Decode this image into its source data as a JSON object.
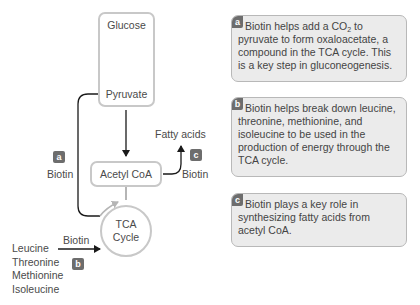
{
  "diagram": {
    "nodes": {
      "glucose": "Glucose",
      "pyruvate": "Pyruvate",
      "acetyl_coa": "Acetyl CoA",
      "tca_line1": "TCA",
      "tca_line2": "Cycle",
      "fatty_acids": "Fatty acids"
    },
    "labels": {
      "biotin_a": "Biotin",
      "biotin_b": "Biotin",
      "biotin_c": "Biotin"
    },
    "amino_acids": [
      "Leucine",
      "Threonine",
      "Methionine",
      "Isoleucine"
    ],
    "badges": {
      "a": "a",
      "b": "b",
      "c": "c"
    }
  },
  "notes": [
    {
      "badge": "a",
      "text_before_sub": "Biotin helps add a CO",
      "sub": "2",
      "text_after_sub": " to pyruvate to form oxaloacetate, a compound in the TCA cycle. This is a key step in gluconeogenesis."
    },
    {
      "badge": "b",
      "text": "Biotin helps break down leucine, threonine, methionine, and isoleucine to be used in the production of energy through the TCA cycle."
    },
    {
      "badge": "c",
      "text": "Biotin plays a key role in synthesizing fatty acids from acetyl CoA."
    }
  ],
  "colors": {
    "box_border": "#c8c8c8",
    "badge": "#6d6d6d",
    "note_bg": "#ebebeb",
    "arrow": "#1a1a1a"
  }
}
